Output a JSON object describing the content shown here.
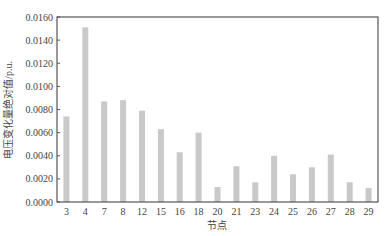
{
  "chart_data": {
    "type": "bar",
    "title": "",
    "xlabel": "节点",
    "ylabel": "电压变化量绝对值/p.u.",
    "categories": [
      "3",
      "4",
      "7",
      "8",
      "12",
      "15",
      "16",
      "18",
      "20",
      "21",
      "23",
      "24",
      "25",
      "26",
      "27",
      "28",
      "29"
    ],
    "values": [
      0.0074,
      0.0151,
      0.0087,
      0.0088,
      0.0079,
      0.0063,
      0.0043,
      0.006,
      0.0013,
      0.0031,
      0.0017,
      0.004,
      0.0024,
      0.003,
      0.0041,
      0.0017,
      0.0012
    ],
    "ylim": [
      0,
      0.016
    ],
    "yticks": [
      "0.0000",
      "0.0020",
      "0.0040",
      "0.0060",
      "0.0080",
      "0.0100",
      "0.0120",
      "0.0140",
      "0.0160"
    ],
    "grid": false,
    "legend": null,
    "colors": {
      "bar": "#c9c9c9",
      "axis": "#555555"
    }
  }
}
